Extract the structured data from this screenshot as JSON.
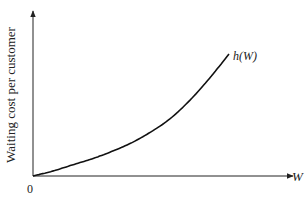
{
  "chart_data": {
    "type": "line",
    "title": "",
    "xlabel": "W",
    "ylabel": "Waiting cost per customer",
    "origin_label": "0",
    "grid": false,
    "legend": "none",
    "series": [
      {
        "name": "h(W)",
        "shape": "convex increasing (exponential-like)",
        "x": [
          0,
          0.1,
          0.2,
          0.3,
          0.4,
          0.5,
          0.6,
          0.7,
          0.8,
          0.9,
          1.0
        ],
        "values": [
          0,
          0.04,
          0.09,
          0.14,
          0.2,
          0.27,
          0.36,
          0.47,
          0.62,
          0.8,
          1.0
        ]
      }
    ],
    "annotations": [
      "h(W)"
    ],
    "xlim": [
      0,
      1.3
    ],
    "ylim": [
      0,
      1.3
    ]
  },
  "labels": {
    "y_axis": "Waiting cost per customer",
    "x_axis": "W",
    "origin": "0",
    "curve": "h(W)"
  }
}
